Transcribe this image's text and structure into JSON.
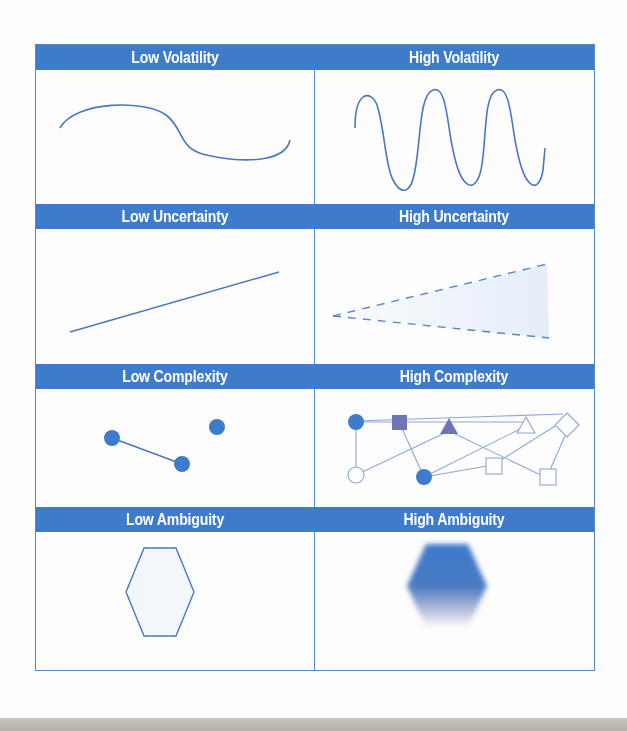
{
  "colors": {
    "header_bg": "#3f7bcb",
    "header_text": "#ffffff",
    "border": "#5b86c6",
    "line": "#4a78bf",
    "node_fill": "#3f7bcb",
    "node_alt_fill": "#6f74b5",
    "light_fill": "#f3f7fc"
  },
  "rows": [
    {
      "left": {
        "title": "Low Volatility",
        "graphic": "gentle-s-curve"
      },
      "right": {
        "title": "High Volatility",
        "graphic": "sine-wave-three-cycles"
      }
    },
    {
      "left": {
        "title": "Low Uncertainty",
        "graphic": "straight-rising-line"
      },
      "right": {
        "title": "High Uncertainty",
        "graphic": "dashed-widening-cone"
      }
    },
    {
      "left": {
        "title": "Low Complexity",
        "graphic": "three-nodes-one-link"
      },
      "right": {
        "title": "High Complexity",
        "graphic": "many-nodes-network"
      }
    },
    {
      "left": {
        "title": "Low Ambiguity",
        "graphic": "crisp-hexagon"
      },
      "right": {
        "title": "High Ambiguity",
        "graphic": "blurred-hexagon"
      }
    }
  ]
}
